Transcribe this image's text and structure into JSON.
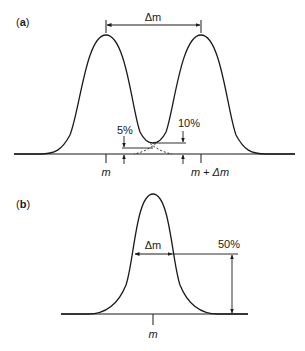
{
  "panel_a": {
    "label_open": "(",
    "label_letter": "a",
    "label_close": ")",
    "delta_m": "Δm",
    "pct_low": "5%",
    "pct_high": "10%",
    "tick_left": "m",
    "tick_right": "m + Δm"
  },
  "panel_b": {
    "label_open": "(",
    "label_letter": "b",
    "label_close": ")",
    "delta_m": "Δm",
    "pct_half": "50%",
    "tick_center": "m"
  },
  "colors": {
    "line": "#1a1a1a",
    "background": "#ffffff"
  }
}
